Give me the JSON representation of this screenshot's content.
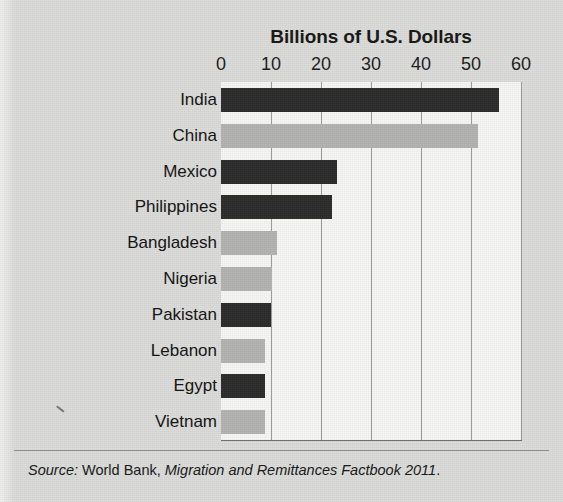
{
  "figure": {
    "title": "Billions of U.S. Dollars",
    "source": {
      "label": "Source:",
      "publisher": " World Bank, ",
      "work": "Migration and Remittances Factbook 2011",
      "terminator": "."
    }
  },
  "colors": {
    "page_background": "#dcdcda",
    "plot_background": "#f7f7f5",
    "bar_dark": "#2b2b2b",
    "bar_light": "#b3b3b1",
    "gridline": "#9a9a98",
    "text": "#161616"
  },
  "chart_data": {
    "type": "bar",
    "orientation": "horizontal",
    "title": "Billions of U.S. Dollars",
    "xlabel": "Billions of U.S. Dollars",
    "ylabel": "",
    "xlim": [
      0,
      60
    ],
    "grid": true,
    "legend": "none",
    "xticks": [
      0,
      10,
      20,
      30,
      40,
      50,
      60
    ],
    "xtick_labels": [
      "0",
      "10",
      "20",
      "30",
      "40",
      "50",
      "60"
    ],
    "categories": [
      "India",
      "China",
      "Mexico",
      "Philippines",
      "Bangladesh",
      "Nigeria",
      "Pakistan",
      "Lebanon",
      "Egypt",
      "Vietnam"
    ],
    "values": [
      55.5,
      51.3,
      23.2,
      22.2,
      11.1,
      10.1,
      10.0,
      8.7,
      8.7,
      8.7
    ],
    "bar_shades": [
      "dark",
      "light",
      "dark",
      "dark",
      "light",
      "light",
      "dark",
      "light",
      "dark",
      "light"
    ]
  }
}
